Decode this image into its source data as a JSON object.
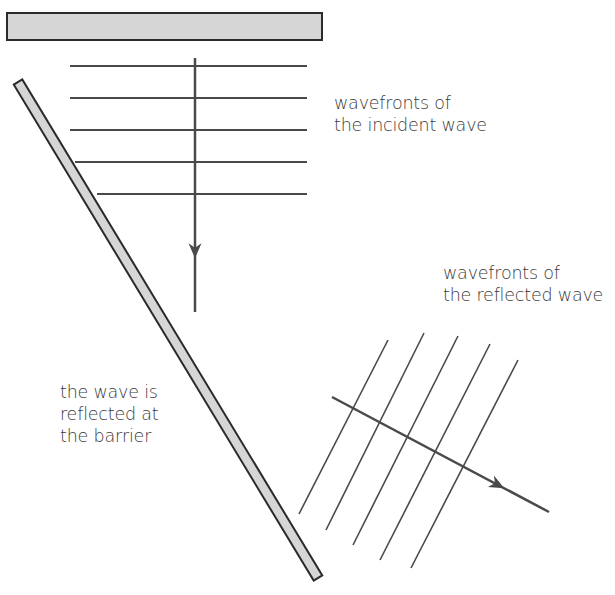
{
  "diagram": {
    "colors": {
      "barrier_fill": "#d6d6d6",
      "barrier_stroke": "#2b2b2b",
      "line": "#4a4a4a",
      "text": "#3a3a3a",
      "background": "#ffffff"
    },
    "barriers": {
      "top": {
        "x": 7,
        "y": 13,
        "width": 315,
        "height": 27
      },
      "diagonal": {
        "x1": 18,
        "y1": 82,
        "x2": 318,
        "y2": 578,
        "thickness": 10
      }
    },
    "incident_wavefronts": [
      {
        "x1": 70,
        "y1": 66,
        "x2": 307,
        "y2": 66
      },
      {
        "x1": 70,
        "y1": 98,
        "x2": 307,
        "y2": 98
      },
      {
        "x1": 70,
        "y1": 130,
        "x2": 307,
        "y2": 130
      },
      {
        "x1": 75,
        "y1": 162,
        "x2": 307,
        "y2": 162
      },
      {
        "x1": 97,
        "y1": 194,
        "x2": 307,
        "y2": 194
      }
    ],
    "incident_ray": {
      "x1": 195,
      "y1": 58,
      "x2": 195,
      "y2": 312,
      "arrow_at": 250
    },
    "reflected_wavefronts": [
      {
        "x1": 299,
        "y1": 514,
        "x2": 388,
        "y2": 340
      },
      {
        "x1": 326,
        "y1": 530,
        "x2": 424,
        "y2": 333
      },
      {
        "x1": 353,
        "y1": 545,
        "x2": 458,
        "y2": 336
      },
      {
        "x1": 380,
        "y1": 560,
        "x2": 490,
        "y2": 344
      },
      {
        "x1": 411,
        "y1": 568,
        "x2": 518,
        "y2": 360
      }
    ],
    "reflected_ray": {
      "x1": 332,
      "y1": 397,
      "x2": 549,
      "y2": 512,
      "arrow_t": 0.76
    }
  },
  "labels": {
    "incident": {
      "line1": "wavefronts of",
      "line2": "the incident wave"
    },
    "reflected": {
      "line1": "wavefronts of",
      "line2": "the reflected wave"
    },
    "barrier": {
      "line1": "the wave is",
      "line2": "reflected at",
      "line3": "the barrier"
    }
  }
}
